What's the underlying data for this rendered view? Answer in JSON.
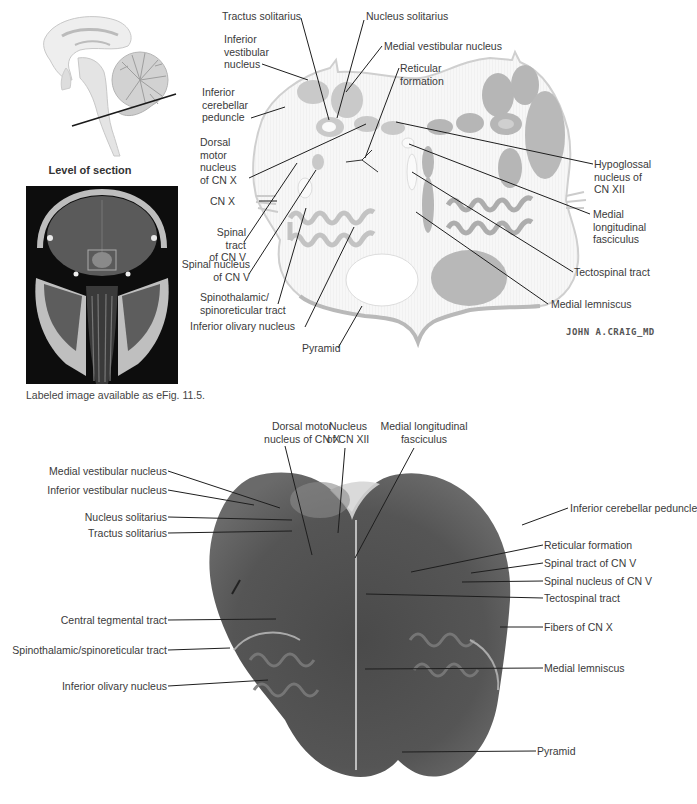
{
  "figure": {
    "sagittal_inset": {
      "caption": "Level of section",
      "section_line_color": "#1a1a1a"
    },
    "mri_inset": {
      "caption": "Labeled image available as eFig. 11.5."
    },
    "illustration": {
      "signature": "JOHN A.CRAIG_MD",
      "labels": {
        "tractus_solitarius": "Tractus solitarius",
        "nucleus_solitarius": "Nucleus solitarius",
        "inferior_vestibular_nucleus": "Inferior\nvestibular\nnucleus",
        "medial_vestibular_nucleus": "Medial vestibular nucleus",
        "reticular_formation": "Reticular\nformation",
        "inferior_cerebellar_peduncle": "Inferior\ncerebellar\npeduncle",
        "dorsal_motor_nucleus_cn_x": "Dorsal\nmotor\nnucleus\nof CN X",
        "cn_x": "CN X",
        "spinal_tract_cn_v": "Spinal tract\nof CN V",
        "spinal_nucleus_cn_v": "Spinal nucleus\nof CN V",
        "spinothalamic_spinoreticular_tract": "Spinothalamic/\nspinoreticular tract",
        "inferior_olivary_nucleus": "Inferior olivary nucleus",
        "pyramid": "Pyramid",
        "hypoglossal_nucleus_cn_xii": "Hypoglossal\nnucleus of\nCN XII",
        "medial_longitudinal_fasciculus": "Medial\nlongitudinal\nfasciculus",
        "tectospinal_tract": "Tectospinal tract",
        "medial_lemniscus": "Medial lemniscus"
      }
    },
    "histology": {
      "labels": {
        "dorsal_motor_nucleus_cn_x": "Dorsal motor\nnucleus of CN X",
        "nucleus_cn_xii": "Nucleus\nof CN XII",
        "medial_longitudinal_fasciculus": "Medial longitudinal\nfasciculus",
        "medial_vestibular_nucleus": "Medial vestibular nucleus",
        "inferior_vestibular_nucleus": "Inferior vestibular nucleus",
        "nucleus_solitarius": "Nucleus solitarius",
        "tractus_solitarius": "Tractus solitarius",
        "central_tegmental_tract": "Central tegmental tract",
        "spinothalamic_spinoreticular_tract": "Spinothalamic/spinoreticular tract",
        "inferior_olivary_nucleus": "Inferior olivary nucleus",
        "inferior_cerebellar_peduncle": "Inferior cerebellar peduncle",
        "reticular_formation": "Reticular formation",
        "spinal_tract_cn_v": "Spinal tract of CN V",
        "spinal_nucleus_cn_v": "Spinal nucleus of CN V",
        "tectospinal_tract": "Tectospinal tract",
        "fibers_cn_x": "Fibers of CN X",
        "medial_lemniscus": "Medial lemniscus",
        "pyramid": "Pyramid"
      }
    }
  }
}
